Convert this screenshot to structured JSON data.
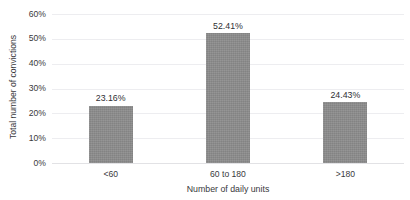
{
  "chart_data": {
    "type": "bar",
    "title": "",
    "categories": [
      "<60",
      "60 to 180",
      ">180"
    ],
    "values": [
      23.16,
      52.41,
      24.43
    ],
    "value_labels": [
      "23.16%",
      "52.41%",
      "24.43%"
    ],
    "xlabel": "Number of daily units",
    "ylabel": "Total number of convictions",
    "ylim": [
      0,
      60
    ],
    "ytick_values": [
      0,
      10,
      20,
      30,
      40,
      50,
      60
    ],
    "ytick_labels": [
      "0%",
      "10%",
      "20%",
      "30%",
      "40%",
      "50%",
      "60%"
    ],
    "grid": true,
    "grid_axis": "y",
    "legend": false,
    "series_color": "#8a8a8a",
    "grid_color": "#ededf0",
    "text_color": "#39393c",
    "background": "#ffffff"
  },
  "axes": {
    "y_title": "Total number of convictions",
    "x_title": "Number of daily units"
  }
}
